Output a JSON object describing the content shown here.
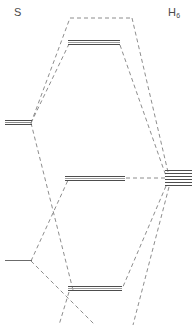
{
  "diagram": {
    "type": "molecular-orbital-correlation-diagram",
    "background": "#ffffff",
    "width": 192,
    "height": 325,
    "line_color": "#555555",
    "dash_color": "#777777",
    "labels": {
      "left_fragment": "S",
      "right_fragment_text": "H",
      "right_fragment_subscript": "6"
    },
    "levels": {
      "left_fragment": [
        {
          "name": "s-upper-level",
          "x1": 5,
          "x2": 32,
          "y": 122,
          "strokes": 3,
          "style": "thick-multiline"
        },
        {
          "name": "s-lower-level",
          "x1": 5,
          "x2": 32,
          "y": 260,
          "strokes": 1,
          "style": "thin-single"
        }
      ],
      "center_mo": [
        {
          "name": "mo-antibonding-top",
          "x1": 68,
          "x2": 120,
          "y": 42,
          "strokes": 3,
          "style": "thick-multiline"
        },
        {
          "name": "mo-nonbonding-middle",
          "x1": 65,
          "x2": 125,
          "y": 178,
          "strokes": 3,
          "style": "thick-multiline"
        },
        {
          "name": "mo-bonding-bottom",
          "x1": 68,
          "x2": 122,
          "y": 288,
          "strokes": 3,
          "style": "thick-multiline"
        }
      ],
      "right_fragment": [
        {
          "name": "h6-level-1",
          "x1": 165,
          "x2": 192,
          "y": 170,
          "strokes": 1,
          "style": "thin-single"
        },
        {
          "name": "h6-level-2",
          "x1": 165,
          "x2": 192,
          "y": 173,
          "strokes": 1,
          "style": "thin-single"
        },
        {
          "name": "h6-level-3",
          "x1": 165,
          "x2": 192,
          "y": 176,
          "strokes": 1,
          "style": "thin-single"
        },
        {
          "name": "h6-level-4",
          "x1": 165,
          "x2": 192,
          "y": 179,
          "strokes": 1,
          "style": "thin-single"
        },
        {
          "name": "h6-level-5",
          "x1": 165,
          "x2": 192,
          "y": 182,
          "strokes": 1,
          "style": "thin-single"
        },
        {
          "name": "h6-level-6",
          "x1": 165,
          "x2": 192,
          "y": 185,
          "strokes": 1,
          "style": "thin-single"
        }
      ]
    },
    "correlation_lines": [
      {
        "name": "top-cap-dashed",
        "points": "70,18 132,18"
      },
      {
        "name": "left-to-topcap-outer",
        "points": "31,123 70,18"
      },
      {
        "name": "left-to-motop-inner",
        "points": "31,123 69,44"
      },
      {
        "name": "topcap-to-h6-outer",
        "points": "132,18 168,172"
      },
      {
        "name": "motop-to-h6-inner",
        "points": "120,45 166,175"
      },
      {
        "name": "mo-middle-to-h6",
        "points": "126,178 165,178"
      },
      {
        "name": "left-cross-down-a",
        "points": "31,123 73,290"
      },
      {
        "name": "left-cross-up-b",
        "points": "31,261 69,178"
      },
      {
        "name": "left-lower-to-mobottom",
        "points": "31,261 71,289"
      },
      {
        "name": "h6-to-mobottom-outer",
        "points": "166,186 122,289"
      },
      {
        "name": "h6-to-below-inner",
        "points": "168,187 132,325"
      },
      {
        "name": "left-lower-to-below",
        "points": "31,261 95,325"
      },
      {
        "name": "mobottom-left-to-below",
        "points": "69,290 60,325"
      }
    ]
  }
}
